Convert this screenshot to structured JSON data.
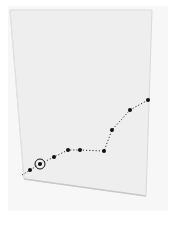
{
  "illustration": {
    "subject": "paper sheet with dotted line graph",
    "colors": {
      "background": "#ffffff",
      "frame": "#f7f7f7",
      "paper": "#eeeeee",
      "paper_edge": "#d6d6d6",
      "line": "#333333",
      "point": "#111111"
    },
    "highlighted_point_index": 1
  },
  "chart_data": {
    "type": "line",
    "title": "",
    "xlabel": "",
    "ylabel": "",
    "grid": false,
    "points_px": [
      [
        30,
        170
      ],
      [
        40,
        164
      ],
      [
        54,
        157
      ],
      [
        68,
        150
      ],
      [
        80,
        150
      ],
      [
        104,
        151
      ],
      [
        112,
        130
      ],
      [
        130,
        110
      ],
      [
        148,
        100
      ]
    ],
    "values": [
      1,
      2,
      3,
      4,
      4,
      4,
      7,
      10,
      11.5
    ]
  }
}
